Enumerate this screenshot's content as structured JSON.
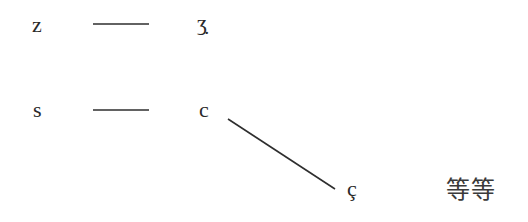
{
  "diagram": {
    "nodes": [
      {
        "id": "z",
        "label": "z"
      },
      {
        "id": "ezh_dot",
        "label": "ʒ̣"
      },
      {
        "id": "s",
        "label": "s"
      },
      {
        "id": "c",
        "label": "c"
      },
      {
        "id": "c_cedilla",
        "label": "ç"
      },
      {
        "id": "etc",
        "label": "等等"
      }
    ],
    "edges": [
      {
        "from": "z",
        "to": "ezh_dot",
        "style": "horizontal"
      },
      {
        "from": "s",
        "to": "c",
        "style": "horizontal"
      },
      {
        "from": "c",
        "to": "c_cedilla",
        "style": "diagonal"
      }
    ],
    "colors": {
      "background": "#ffffff",
      "ink": "#2e2e2e"
    }
  }
}
